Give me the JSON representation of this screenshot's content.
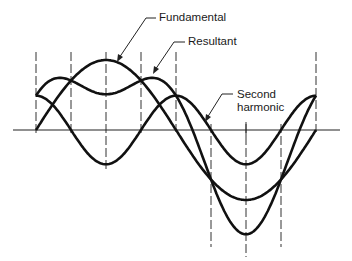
{
  "figure": {
    "labels": {
      "fundamental": "Fundamental",
      "resultant": "Resultant",
      "second_harmonic_line1": "Second",
      "second_harmonic_line2": "harmonic"
    },
    "colors": {
      "curve": "#111111",
      "axis": "#222222",
      "dashed": "#333333",
      "background": "#ffffff"
    }
  },
  "chart_data": {
    "type": "line",
    "title": "",
    "xlabel": "",
    "ylabel": "",
    "x_unit": "degrees",
    "x": [
      0,
      45,
      90,
      135,
      180,
      225,
      270,
      315,
      360
    ],
    "series": [
      {
        "name": "Fundamental",
        "amplitude": 1.0,
        "formula": "sin(x)",
        "values": [
          0,
          0.71,
          1.0,
          0.71,
          0,
          -0.71,
          -1.0,
          -0.71,
          0
        ]
      },
      {
        "name": "Second harmonic",
        "amplitude": 0.49,
        "formula": "0.49*cos(2x)",
        "values": [
          0.49,
          0,
          -0.49,
          0,
          0.49,
          0,
          -0.49,
          0,
          0.49
        ]
      },
      {
        "name": "Resultant",
        "formula": "sin(x)+0.49*cos(2x)",
        "values": [
          0.49,
          0.71,
          0.51,
          0.71,
          0.49,
          -0.71,
          -1.49,
          -0.71,
          0.49
        ]
      }
    ],
    "grid": false,
    "legend": "leader-line annotations"
  }
}
